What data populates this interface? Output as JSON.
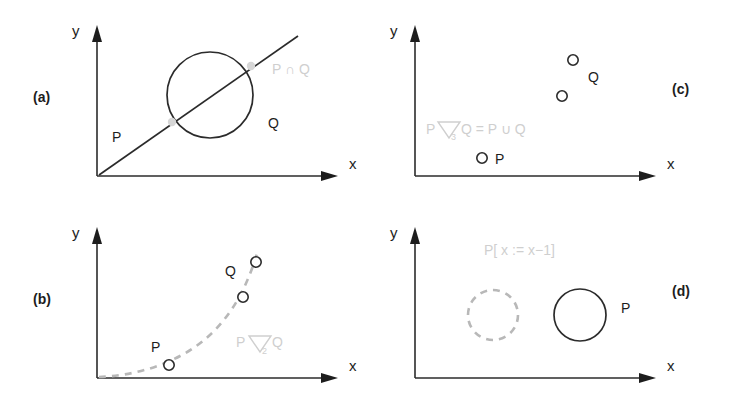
{
  "figure": {
    "background_color": "#ffffff",
    "ink_color": "#2b2b2b",
    "faint_color": "#cfcfcf",
    "width": 734,
    "height": 404
  },
  "panels": [
    {
      "id": "a",
      "label": "(a)",
      "axis_x_label": "x",
      "axis_y_label": "y",
      "annotation": "P ∩ Q",
      "shapes": [
        {
          "kind": "line",
          "label": "P"
        },
        {
          "kind": "circle",
          "label": "Q"
        }
      ],
      "point_labels": [
        "P",
        "Q"
      ]
    },
    {
      "id": "b",
      "label": "(b)",
      "axis_x_label": "x",
      "axis_y_label": "y",
      "annotation_prefix": "P",
      "annotation_subscript": "2",
      "annotation_suffix": "Q",
      "annotation_full": "P ∇2 Q",
      "point_labels": [
        "P",
        "Q"
      ],
      "points": [
        {
          "label": "P",
          "x": 169,
          "y": 365
        },
        {
          "label": "",
          "x": 243,
          "y": 297
        },
        {
          "label": "Q",
          "x": 256,
          "y": 262
        }
      ]
    },
    {
      "id": "c",
      "label": "(c)",
      "axis_x_label": "x",
      "axis_y_label": "y",
      "annotation_prefix": "P",
      "annotation_subscript": "3",
      "annotation_suffix": "Q = P ∪ Q",
      "annotation_full": "P ∇3 Q = P ∪ Q",
      "point_labels": [
        "P",
        "Q"
      ],
      "points": [
        {
          "label": "Q",
          "x": 573,
          "y": 60
        },
        {
          "label": "",
          "x": 562,
          "y": 96
        },
        {
          "label": "P",
          "x": 482,
          "y": 158
        }
      ]
    },
    {
      "id": "d",
      "label": "(d)",
      "axis_x_label": "x",
      "axis_y_label": "y",
      "annotation": "P[ x := x−1]",
      "point_labels": [
        "P"
      ],
      "shapes": [
        {
          "kind": "dashed-circle",
          "label": ""
        },
        {
          "kind": "circle",
          "label": "P"
        }
      ]
    }
  ]
}
